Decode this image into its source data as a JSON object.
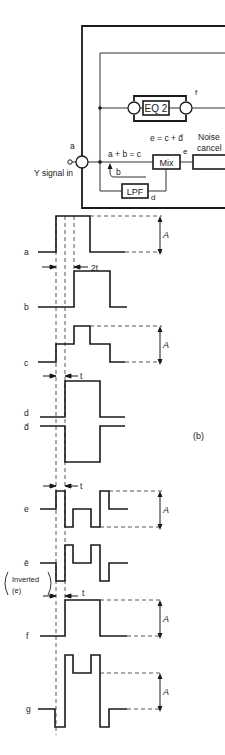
{
  "block_diagram": {
    "input_label": "Y signal in",
    "input_node_label": "a",
    "eq_label": "EQ 2",
    "eq_output_label": "f",
    "sum_label": "a + b = c",
    "feedback_label": "b",
    "mix_label": "Mix",
    "mix_equation": "e = c + d̄",
    "mix_output_label": "e",
    "lpf_label": "LPF",
    "lpf_output_label": "d",
    "noise_cancel_label_line1": "Noise",
    "noise_cancel_label_line2": "cancel"
  },
  "waveforms": {
    "panel_label": "(b)",
    "amplitude_label": "A",
    "delay_2t_label": "2t",
    "delay_t_label": "t",
    "rows": [
      {
        "name": "a",
        "label": "a",
        "points": "38,252 56,252 56,216 90,216 90,252 125,252"
      },
      {
        "name": "b",
        "label": "b",
        "points": "38,307 74,307 74,271 110,271 110,307 127,307"
      },
      {
        "name": "c",
        "label": "c",
        "points": "38,362 56,362 56,344 74,344 74,326 90,326 90,344 110,344 110,362 125,362"
      },
      {
        "name": "d",
        "label": "d",
        "points": "40,417 65,417 65,381 100,381 100,417 125,417"
      },
      {
        "name": "d-bar",
        "label": "d̄",
        "points": "40,426 65,426 65,462 100,462 100,426 125,426"
      },
      {
        "name": "e",
        "label": "e",
        "points": "40,509 56,509 56,491 65,491 65,527 73,527 73,509 91,509 91,527 100,527 100,491 109,491 109,509 128,509"
      },
      {
        "name": "e-bar",
        "label": "ē",
        "points": "40,563 56,563 56,581 65,581 65,545 73,545 73,563 91,563 91,545 100,545 100,581 109,581 109,563 128,563"
      },
      {
        "name": "f",
        "label": "f",
        "points": "40,636 65,636 65,600 100,600 100,636 127,636"
      },
      {
        "name": "g",
        "label": "g",
        "points": "38,709 55,709 55,727 65,727 65,655 73,655 73,673 91,673 91,655 100,655 100,727 109,727 109,709 127,709"
      }
    ],
    "inverted_note_line1": "Inverted",
    "inverted_note_line2": "(e)"
  }
}
